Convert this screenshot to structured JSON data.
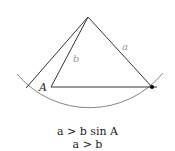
{
  "diagram": {
    "type": "geometry-ambiguous-case",
    "labels": {
      "vertex_A": "A",
      "side_a": "a",
      "side_b": "b"
    },
    "points": {
      "apex": [
        88,
        17
      ],
      "A": [
        51,
        87
      ],
      "right_vertex": [
        152,
        87
      ],
      "left_arc_hit": [
        26,
        87
      ]
    },
    "arc": {
      "center": [
        88,
        17
      ],
      "radius": 95
    },
    "colors": {
      "line": "#333333",
      "label": "#888888",
      "arc": "#777777"
    }
  },
  "conditions": {
    "line1": "a > b sin A",
    "line2": "a > b"
  }
}
